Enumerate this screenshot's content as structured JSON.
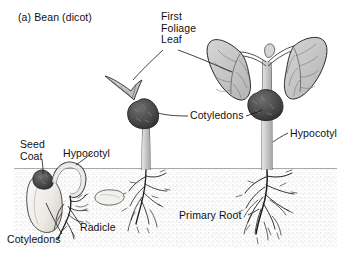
{
  "figure": {
    "title": "(a) Bean (dicot)",
    "style": "black-and-white stippled line drawing",
    "soil_line_y": 168,
    "colors": {
      "background": "#ffffff",
      "ink": "#111111",
      "soil_stipple": "#8d8d8d",
      "cotyledon_dark": "#4a4a4a",
      "leaf_fill": "#c9c9c9",
      "stem_fill": "#c4c4c4",
      "seed_pale": "#f0efec"
    }
  },
  "labels": {
    "seed_coat": "Seed\nCoat",
    "hypocotyl_left": "Hypocotyl",
    "radicle": "Radicle",
    "cotyledons_bottom": "Cotyledons",
    "first_foliage_leaf": "First\nFoliage\nLeaf",
    "cotyledons_middle": "Cotyledons",
    "hypocotyl_right": "Hypocotyl",
    "primary_root": "Primary Root"
  },
  "stages": [
    {
      "name": "germinating-seed",
      "order": 1,
      "parts": [
        "seed coat",
        "cotyledons",
        "hypocotyl hook",
        "radicle"
      ],
      "position": "below soil, left"
    },
    {
      "name": "emerging-seedling",
      "order": 2,
      "parts": [
        "cotyledons",
        "first foliage leaf",
        "hypocotyl",
        "primary root"
      ],
      "position": "center, shoot above soil"
    },
    {
      "name": "young-plant",
      "order": 3,
      "parts": [
        "first foliage leaf",
        "cotyledons",
        "hypocotyl",
        "primary root"
      ],
      "position": "right, two expanded leaves"
    }
  ]
}
